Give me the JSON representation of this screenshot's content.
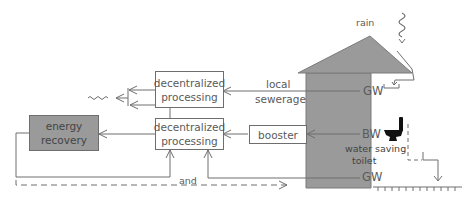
{
  "diagram": {
    "nodes": {
      "decentral_top": {
        "line1": "decentralized",
        "line2": "processing"
      },
      "decentral_main": {
        "line1": "decentralized",
        "line2": "processing"
      },
      "energy_recovery": {
        "line1": "energy",
        "line2": "recovery"
      },
      "booster": {
        "label": "booster"
      }
    },
    "house": {
      "rain_label": "rain",
      "gw_top": "GW",
      "bw": "BW",
      "toilet_line1": "water saving",
      "toilet_line2": "toilet",
      "gw_bottom": "GW"
    },
    "edges": {
      "local_sewerage_line1": "local",
      "local_sewerage_line2": "sewerage",
      "and_label": "and"
    },
    "colors": {
      "house_fill": "#9a9a9a",
      "energy_fill": "#9a9a9a",
      "line": "#6e6e6e"
    }
  }
}
